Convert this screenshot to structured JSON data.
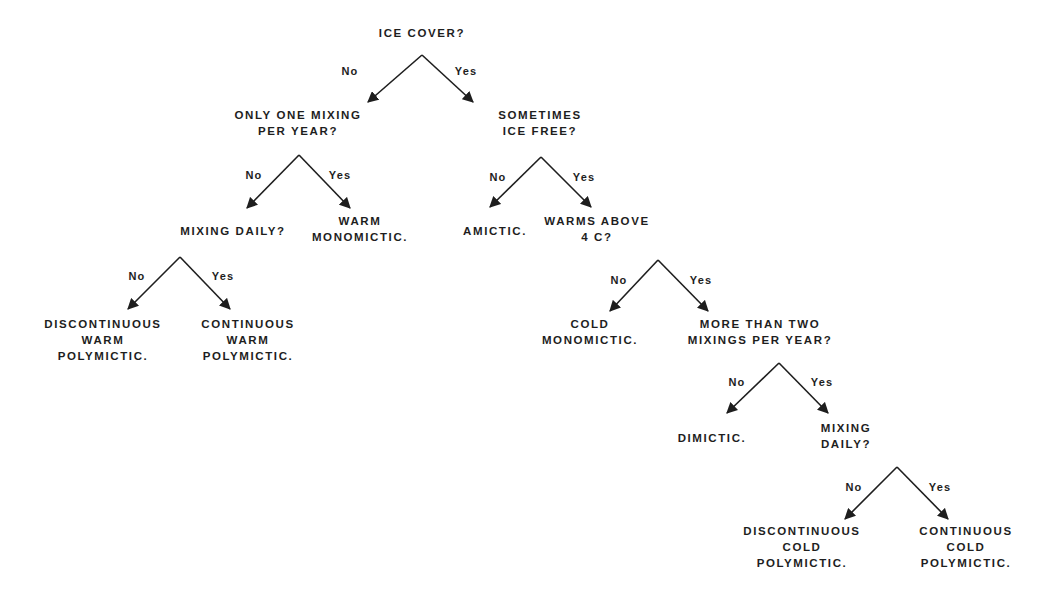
{
  "diagram": {
    "type": "decision-tree",
    "topic": "Lake mixing classification",
    "colors": {
      "background": "#ffffff",
      "ink": "#1e1e1e"
    },
    "nodes": [
      {
        "id": "ice_cover",
        "kind": "question",
        "lines": [
          "ICE COVER?"
        ],
        "x": 422,
        "y": 25
      },
      {
        "id": "only_one_mixing",
        "kind": "question",
        "lines": [
          "ONLY ONE MIXING",
          "PER YEAR?"
        ],
        "x": 298,
        "y": 107
      },
      {
        "id": "sometimes_ice_free",
        "kind": "question",
        "lines": [
          "SOMETIMES",
          "ICE FREE?"
        ],
        "x": 540,
        "y": 107
      },
      {
        "id": "mixing_daily_warm",
        "kind": "question",
        "lines": [
          "MIXING DAILY?"
        ],
        "x": 233,
        "y": 223
      },
      {
        "id": "warm_monomictic",
        "kind": "outcome",
        "lines": [
          "WARM",
          "MONOMICTIC."
        ],
        "x": 360,
        "y": 213
      },
      {
        "id": "amictic",
        "kind": "outcome",
        "lines": [
          "AMICTIC."
        ],
        "x": 495,
        "y": 223
      },
      {
        "id": "warms_above_4c",
        "kind": "question",
        "lines": [
          "WARMS ABOVE",
          "4 C?"
        ],
        "x": 597,
        "y": 213
      },
      {
        "id": "discontinuous_warm_polymictic",
        "kind": "outcome",
        "lines": [
          "DISCONTINUOUS",
          "WARM",
          "POLYMICTIC."
        ],
        "x": 103,
        "y": 316
      },
      {
        "id": "continuous_warm_polymictic",
        "kind": "outcome",
        "lines": [
          "CONTINUOUS",
          "WARM",
          "POLYMICTIC."
        ],
        "x": 248,
        "y": 316
      },
      {
        "id": "cold_monomictic",
        "kind": "outcome",
        "lines": [
          "COLD",
          "MONOMICTIC."
        ],
        "x": 590,
        "y": 316
      },
      {
        "id": "more_than_two_mixings",
        "kind": "question",
        "lines": [
          "MORE THAN TWO",
          "MIXINGS PER YEAR?"
        ],
        "x": 760,
        "y": 316
      },
      {
        "id": "dimictic",
        "kind": "outcome",
        "lines": [
          "DIMICTIC."
        ],
        "x": 712,
        "y": 430
      },
      {
        "id": "mixing_daily_cold",
        "kind": "question",
        "lines": [
          "MIXING",
          "DAILY?"
        ],
        "x": 846,
        "y": 420
      },
      {
        "id": "discontinuous_cold_polymictic",
        "kind": "outcome",
        "lines": [
          "DISCONTINUOUS",
          "COLD",
          "POLYMICTIC."
        ],
        "x": 802,
        "y": 523
      },
      {
        "id": "continuous_cold_polymictic",
        "kind": "outcome",
        "lines": [
          "CONTINUOUS",
          "COLD",
          "POLYMICTIC."
        ],
        "x": 966,
        "y": 523
      }
    ],
    "edges": [
      {
        "from": "ice_cover",
        "to": "only_one_mixing",
        "label": "No",
        "x1": 422,
        "y1": 55,
        "x2": 368,
        "y2": 102,
        "lx": 350,
        "ly": 64
      },
      {
        "from": "ice_cover",
        "to": "sometimes_ice_free",
        "label": "Yes",
        "x1": 422,
        "y1": 55,
        "x2": 473,
        "y2": 102,
        "lx": 466,
        "ly": 64
      },
      {
        "from": "only_one_mixing",
        "to": "mixing_daily_warm",
        "label": "No",
        "x1": 299,
        "y1": 155,
        "x2": 247,
        "y2": 208,
        "lx": 254,
        "ly": 168
      },
      {
        "from": "only_one_mixing",
        "to": "warm_monomictic",
        "label": "Yes",
        "x1": 299,
        "y1": 155,
        "x2": 350,
        "y2": 208,
        "lx": 340,
        "ly": 168
      },
      {
        "from": "sometimes_ice_free",
        "to": "amictic",
        "label": "No",
        "x1": 541,
        "y1": 157,
        "x2": 490,
        "y2": 207,
        "lx": 498,
        "ly": 170
      },
      {
        "from": "sometimes_ice_free",
        "to": "warms_above_4c",
        "label": "Yes",
        "x1": 541,
        "y1": 157,
        "x2": 591,
        "y2": 207,
        "lx": 584,
        "ly": 170
      },
      {
        "from": "mixing_daily_warm",
        "to": "discontinuous_warm_polymictic",
        "label": "No",
        "x1": 180,
        "y1": 257,
        "x2": 128,
        "y2": 309,
        "lx": 137,
        "ly": 269
      },
      {
        "from": "mixing_daily_warm",
        "to": "continuous_warm_polymictic",
        "label": "Yes",
        "x1": 180,
        "y1": 257,
        "x2": 230,
        "y2": 309,
        "lx": 223,
        "ly": 269
      },
      {
        "from": "warms_above_4c",
        "to": "cold_monomictic",
        "label": "No",
        "x1": 658,
        "y1": 260,
        "x2": 610,
        "y2": 311,
        "lx": 619,
        "ly": 273
      },
      {
        "from": "warms_above_4c",
        "to": "more_than_two_mixings",
        "label": "Yes",
        "x1": 658,
        "y1": 260,
        "x2": 708,
        "y2": 311,
        "lx": 701,
        "ly": 273
      },
      {
        "from": "more_than_two_mixings",
        "to": "dimictic",
        "label": "No",
        "x1": 779,
        "y1": 363,
        "x2": 727,
        "y2": 413,
        "lx": 737,
        "ly": 375
      },
      {
        "from": "more_than_two_mixings",
        "to": "mixing_daily_cold",
        "label": "Yes",
        "x1": 779,
        "y1": 363,
        "x2": 828,
        "y2": 413,
        "lx": 822,
        "ly": 375
      },
      {
        "from": "mixing_daily_cold",
        "to": "discontinuous_cold_polymictic",
        "label": "No",
        "x1": 897,
        "y1": 467,
        "x2": 845,
        "y2": 519,
        "lx": 854,
        "ly": 480
      },
      {
        "from": "mixing_daily_cold",
        "to": "continuous_cold_polymictic",
        "label": "Yes",
        "x1": 897,
        "y1": 467,
        "x2": 948,
        "y2": 519,
        "lx": 940,
        "ly": 480
      }
    ]
  }
}
